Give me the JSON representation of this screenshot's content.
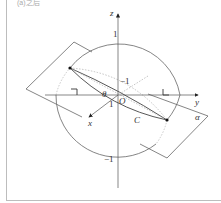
{
  "caption": "(a)之后",
  "diagram": {
    "axes": {
      "x_label": "x",
      "y_label": "y",
      "z_label": "z",
      "origin_label": "O"
    },
    "ticks": {
      "z_top": "1",
      "z_bottom": "−1",
      "x_near": "1",
      "x_far": "−1"
    },
    "labels": {
      "angle": "θ",
      "curve": "C",
      "plane": "α"
    },
    "colors": {
      "line": "#555555",
      "dotted": "#b0b0b0",
      "point": "#111111"
    }
  }
}
